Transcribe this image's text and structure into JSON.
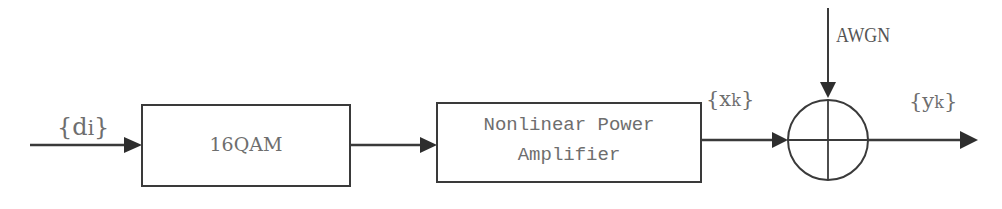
{
  "diagram": {
    "title": "",
    "blocks": [
      {
        "id": "mod",
        "label": "16QAM"
      },
      {
        "id": "pa",
        "label_line1": "Nonlinear Power",
        "label_line2": "Amplifier"
      }
    ],
    "signals": {
      "input": "{d",
      "input_sub": "i",
      "input_close": "}",
      "pa_output": "{x",
      "pa_output_sub": "k",
      "pa_output_close": "}",
      "output": "{y",
      "output_sub": "k",
      "output_close": "}"
    },
    "noise": {
      "label": "AWGN"
    },
    "summer": {
      "symbol": "adder"
    },
    "colors": {
      "line": "#3a3a3a",
      "text": "#6e6e6e",
      "background": "#ffffff"
    }
  }
}
